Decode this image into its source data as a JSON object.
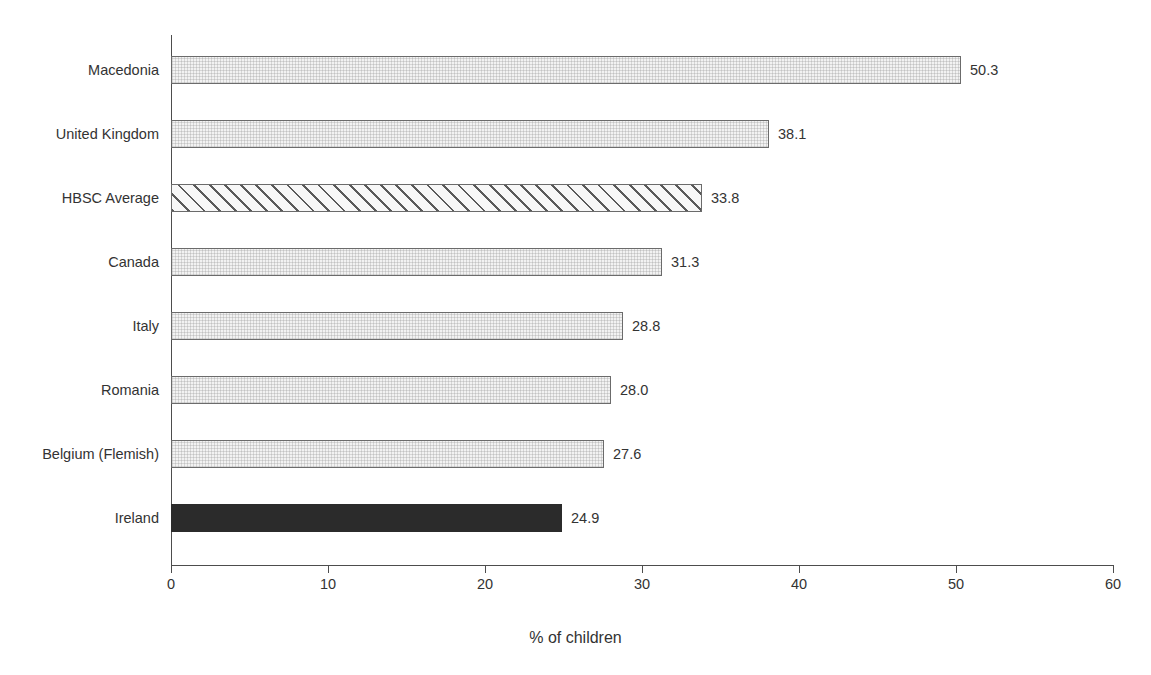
{
  "chart_data": {
    "type": "bar",
    "orientation": "horizontal",
    "title": "",
    "xlabel": "% of children",
    "ylabel": "",
    "xlim": [
      0,
      60
    ],
    "xticks": [
      "0",
      "10",
      "20",
      "30",
      "40",
      "50",
      "60"
    ],
    "grid": false,
    "legend": "none",
    "categories": [
      "Macedonia",
      "United Kingdom",
      "HBSC Average",
      "Canada",
      "Italy",
      "Romania",
      "Belgium (Flemish)",
      "Ireland"
    ],
    "values": [
      50.3,
      38.1,
      33.8,
      31.3,
      28.8,
      28.0,
      27.6,
      24.9
    ],
    "value_labels": [
      "50.3",
      "38.1",
      "33.8",
      "31.3",
      "28.8",
      "28.0",
      "27.6",
      "24.9"
    ],
    "bar_styles": [
      "dotted",
      "dotted",
      "hatched",
      "dotted",
      "dotted",
      "dotted",
      "dotted",
      "solid"
    ],
    "colors": {
      "bar_fill": "#f2f2f2",
      "bar_edge": "#6b6b6b",
      "highlight_fill": "#2b2b2b",
      "hatch_stroke": "#5a5a5a",
      "axis": "#4d4d4d",
      "text": "#333333",
      "background": "#ffffff"
    }
  },
  "title_remnant": " "
}
